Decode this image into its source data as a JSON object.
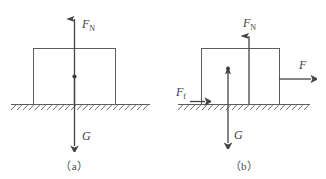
{
  "figure": {
    "background_color": "#ffffff",
    "stroke_color": "#5d5d5d",
    "vector_color": "#444444",
    "text_color": "#3d3d3d"
  },
  "panels": [
    {
      "id": "a",
      "caption": "（a）",
      "description": "Block at rest on horizontal ground",
      "forces": [
        {
          "name": "normal-force",
          "symbol": "F",
          "subscript": "N",
          "label": "F_N",
          "direction": "up",
          "label_position": "above-right"
        },
        {
          "name": "gravity-force",
          "symbol": "G",
          "subscript": "",
          "label": "G",
          "direction": "down",
          "label_position": "right"
        }
      ],
      "has_center_of_mass_dot": true,
      "has_ground_hatching": true
    },
    {
      "id": "b",
      "caption": "（b）",
      "description": "Block pulled right on horizontal ground with friction",
      "forces": [
        {
          "name": "normal-force",
          "symbol": "F",
          "subscript": "N",
          "label": "F_N",
          "direction": "up",
          "label_position": "above"
        },
        {
          "name": "gravity-force",
          "symbol": "G",
          "subscript": "",
          "label": "G",
          "direction": "down",
          "label_position": "right"
        },
        {
          "name": "applied-force",
          "symbol": "F",
          "subscript": "",
          "label": "F",
          "direction": "right",
          "label_position": "above"
        },
        {
          "name": "friction-force",
          "symbol": "F",
          "subscript": "f",
          "label": "F_f",
          "direction": "right",
          "label_position": "above-left"
        }
      ],
      "has_center_of_mass_dot": true,
      "has_ground_hatching": true
    }
  ]
}
